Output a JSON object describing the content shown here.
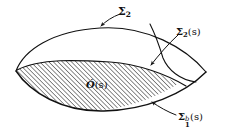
{
  "figure": {
    "kind": "mathematical-diagram",
    "background_color": "#ffffff",
    "ink_color": "#111111",
    "hatch_color": "#1a1a1a",
    "labels": {
      "sigma_2": {
        "symbol": "Σ",
        "subscript": "2",
        "superscript": "",
        "argument": "",
        "full_text": "Σ₂",
        "name": "sigma-2"
      },
      "sigma_2_s": {
        "symbol": "Σ",
        "subscript": "2",
        "superscript": "",
        "argument": "(s)",
        "full_text": "Σ₂(s)",
        "name": "sigma-2-of-s"
      },
      "region_o_s": {
        "symbol": "Ó",
        "subscript": "",
        "superscript": "",
        "argument": "(s)",
        "full_text": "Ó(s)",
        "name": "script-o-of-s"
      },
      "sigma_1_b_s": {
        "symbol": "Σ",
        "subscript": "1",
        "superscript": "b",
        "argument": "(s)",
        "full_text": "Σ₁ᵇ(s)",
        "name": "sigma-1-b-of-s"
      }
    },
    "annotations": {
      "leader_sigma2": "arrow from Σ₂ label down-left to upper boundary curve",
      "leader_sigma2s": "curved arrow from Σ₂(s) label down-left to interior dividing curve",
      "leader_sigma1bs": "curved arrow from Σ₁ᵇ(s) label up-left to lower boundary curve"
    }
  }
}
